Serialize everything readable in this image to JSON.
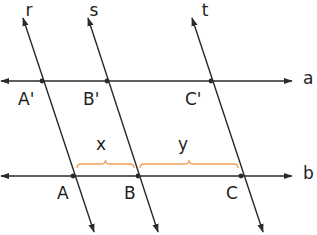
{
  "diagram": {
    "type": "parallel-lines-transversal",
    "colors": {
      "line": "#2a2a2a",
      "brace": "#f0a050",
      "text": "#222222"
    },
    "horizontal_lines": [
      {
        "id": "a",
        "label": "a",
        "y": 81,
        "x1": 0,
        "x2": 300,
        "label_x": 303,
        "label_y": 84
      },
      {
        "id": "b",
        "label": "b",
        "y": 176,
        "x1": 0,
        "x2": 300,
        "label_x": 303,
        "label_y": 179
      }
    ],
    "transversals": [
      {
        "id": "r",
        "label": "r",
        "x1": 23,
        "y1": 18,
        "x2": 94,
        "y2": 232,
        "label_x": 29,
        "label_y": 16
      },
      {
        "id": "s",
        "label": "s",
        "x1": 88,
        "y1": 18,
        "x2": 158,
        "y2": 232,
        "label_x": 94,
        "label_y": 16
      },
      {
        "id": "t",
        "label": "t",
        "x1": 192,
        "y1": 18,
        "x2": 263,
        "y2": 232,
        "label_x": 205,
        "label_y": 16
      }
    ],
    "points": [
      {
        "id": "A'",
        "label": "A'",
        "x": 42,
        "y": 81,
        "label_x": 18,
        "label_y": 105
      },
      {
        "id": "B'",
        "label": "B'",
        "x": 107,
        "y": 81,
        "label_x": 83,
        "label_y": 105
      },
      {
        "id": "C'",
        "label": "C'",
        "x": 211,
        "y": 81,
        "label_x": 185,
        "label_y": 105
      },
      {
        "id": "A",
        "label": "A",
        "x": 73,
        "y": 176,
        "label_x": 57,
        "label_y": 199
      },
      {
        "id": "B",
        "label": "B",
        "x": 138,
        "y": 176,
        "label_x": 124,
        "label_y": 199
      },
      {
        "id": "C",
        "label": "C",
        "x": 241,
        "y": 176,
        "label_x": 226,
        "label_y": 199
      }
    ],
    "braces": [
      {
        "id": "x",
        "label": "x",
        "x1": 77,
        "x2": 134,
        "y": 164,
        "label_x": 101,
        "label_y": 150
      },
      {
        "id": "y",
        "label": "y",
        "x1": 140,
        "x2": 238,
        "y": 164,
        "label_x": 183,
        "label_y": 150
      }
    ]
  }
}
